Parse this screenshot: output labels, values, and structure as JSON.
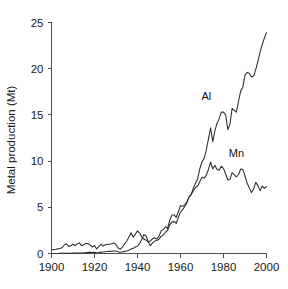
{
  "chart_data": {
    "type": "line",
    "title": "",
    "xlabel": "",
    "ylabel": "Metal production (Mt)",
    "xlim": [
      1900,
      2000
    ],
    "ylim": [
      0,
      25
    ],
    "xticks": [
      1900,
      1920,
      1940,
      1960,
      1980,
      2000
    ],
    "xticklabels": [
      "1900",
      "1920",
      "1940",
      "1960",
      "1980",
      "2000"
    ],
    "yticks": [
      0,
      5,
      10,
      15,
      20,
      25
    ],
    "yticklabels": [
      "0",
      "5",
      "10",
      "15",
      "20",
      "25"
    ],
    "grid": false,
    "legend_position": "inline-annotation",
    "annotations": [
      {
        "text": "Al",
        "x": 1972,
        "y": 16.6
      },
      {
        "text": "Mn",
        "x": 1986,
        "y": 10.4
      }
    ],
    "series": [
      {
        "name": "Al",
        "label": "Al",
        "color": "#2b2b2b",
        "x": [
          1900,
          1901,
          1902,
          1903,
          1904,
          1905,
          1906,
          1907,
          1908,
          1909,
          1910,
          1911,
          1912,
          1913,
          1914,
          1915,
          1916,
          1917,
          1918,
          1919,
          1920,
          1921,
          1922,
          1923,
          1924,
          1925,
          1926,
          1927,
          1928,
          1929,
          1930,
          1931,
          1932,
          1933,
          1934,
          1935,
          1936,
          1937,
          1938,
          1939,
          1940,
          1941,
          1942,
          1943,
          1944,
          1945,
          1946,
          1947,
          1948,
          1949,
          1950,
          1951,
          1952,
          1953,
          1954,
          1955,
          1956,
          1957,
          1958,
          1959,
          1960,
          1961,
          1962,
          1963,
          1964,
          1965,
          1966,
          1967,
          1968,
          1969,
          1970,
          1971,
          1972,
          1973,
          1974,
          1975,
          1976,
          1977,
          1978,
          1979,
          1980,
          1981,
          1982,
          1983,
          1984,
          1985,
          1986,
          1987,
          1988,
          1989,
          1990,
          1991,
          1992,
          1993,
          1994,
          1995,
          1996,
          1997,
          1998,
          1999,
          2000
        ],
        "y": [
          0.01,
          0.01,
          0.01,
          0.01,
          0.02,
          0.02,
          0.02,
          0.02,
          0.02,
          0.03,
          0.04,
          0.04,
          0.05,
          0.06,
          0.06,
          0.07,
          0.09,
          0.12,
          0.13,
          0.1,
          0.12,
          0.08,
          0.11,
          0.15,
          0.17,
          0.19,
          0.21,
          0.23,
          0.25,
          0.27,
          0.27,
          0.2,
          0.14,
          0.18,
          0.23,
          0.28,
          0.36,
          0.49,
          0.56,
          0.7,
          0.8,
          1.1,
          1.55,
          2.05,
          1.9,
          1.25,
          0.85,
          1.15,
          1.35,
          1.4,
          1.55,
          1.85,
          2.0,
          2.3,
          2.5,
          3.1,
          3.4,
          3.45,
          3.25,
          3.9,
          4.5,
          4.75,
          5.1,
          5.5,
          6.1,
          6.4,
          7.1,
          7.6,
          8.1,
          9.2,
          9.9,
          10.3,
          11.2,
          12.4,
          13.6,
          12.1,
          13.3,
          14.1,
          14.6,
          15.3,
          15.3,
          15.0,
          13.4,
          14.0,
          15.7,
          15.5,
          15.3,
          16.5,
          17.6,
          18.0,
          19.3,
          19.6,
          19.5,
          19.1,
          19.2,
          19.9,
          20.8,
          21.8,
          22.6,
          23.3,
          23.9
        ],
        "final_value": 23.9,
        "final_year": 2000
      },
      {
        "name": "Mn",
        "label": "Mn",
        "color": "#2b2b2b",
        "x": [
          1900,
          1901,
          1902,
          1903,
          1904,
          1905,
          1906,
          1907,
          1908,
          1909,
          1910,
          1911,
          1912,
          1913,
          1914,
          1915,
          1916,
          1917,
          1918,
          1919,
          1920,
          1921,
          1922,
          1923,
          1924,
          1925,
          1926,
          1927,
          1928,
          1929,
          1930,
          1931,
          1932,
          1933,
          1934,
          1935,
          1936,
          1937,
          1938,
          1939,
          1940,
          1941,
          1942,
          1943,
          1944,
          1945,
          1946,
          1947,
          1948,
          1949,
          1950,
          1951,
          1952,
          1953,
          1954,
          1955,
          1956,
          1957,
          1958,
          1959,
          1960,
          1961,
          1962,
          1963,
          1964,
          1965,
          1966,
          1967,
          1968,
          1969,
          1970,
          1971,
          1972,
          1973,
          1974,
          1975,
          1976,
          1977,
          1978,
          1979,
          1980,
          1981,
          1982,
          1983,
          1984,
          1985,
          1986,
          1987,
          1988,
          1989,
          1990,
          1991,
          1992,
          1993,
          1994,
          1995,
          1996,
          1997,
          1998,
          1999,
          2000
        ],
        "y": [
          0.4,
          0.42,
          0.45,
          0.5,
          0.55,
          0.65,
          0.95,
          1.05,
          0.75,
          0.85,
          1.0,
          0.85,
          1.05,
          1.15,
          0.85,
          0.95,
          1.1,
          1.05,
          0.9,
          0.7,
          0.85,
          0.5,
          0.75,
          1.0,
          0.8,
          0.95,
          1.0,
          1.0,
          1.05,
          1.15,
          0.95,
          0.6,
          0.45,
          0.7,
          1.05,
          1.35,
          1.75,
          2.25,
          1.75,
          2.1,
          2.45,
          2.2,
          1.8,
          1.55,
          1.45,
          1.25,
          1.35,
          1.6,
          1.7,
          1.55,
          1.9,
          2.45,
          2.6,
          2.9,
          2.7,
          3.6,
          4.15,
          4.2,
          3.9,
          4.55,
          5.2,
          5.1,
          5.3,
          5.6,
          6.1,
          6.4,
          6.8,
          7.15,
          7.3,
          7.8,
          8.25,
          8.15,
          8.45,
          9.1,
          9.9,
          9.15,
          9.55,
          9.1,
          9.0,
          9.45,
          9.2,
          8.6,
          7.95,
          8.0,
          8.75,
          8.5,
          8.3,
          8.55,
          9.15,
          9.1,
          8.4,
          7.6,
          7.1,
          6.6,
          6.95,
          7.7,
          7.35,
          6.8,
          7.3,
          7.05,
          7.25
        ],
        "final_value": 7.25,
        "final_year": 2000
      }
    ]
  }
}
